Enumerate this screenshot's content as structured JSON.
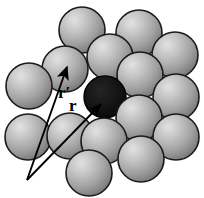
{
  "figure": {
    "background_color": "#ffffff",
    "width": 204,
    "height": 198,
    "sphere_radius": 23,
    "colors": {
      "sphere_fill_light": "#d8d8d8",
      "sphere_fill_mid": "#9a9a9a",
      "sphere_fill_dark": "#6e6e6e",
      "sphere_outline": "#1a1a1a",
      "dark_sphere_fill": "#141414",
      "dark_sphere_outline": "#000000",
      "vector_color": "#000000"
    },
    "spheres": [
      {
        "name": "sphere-top-center",
        "cx": 82,
        "cy": 30,
        "r": 23,
        "shade": "light"
      },
      {
        "name": "sphere-top-right",
        "cx": 139,
        "cy": 33,
        "r": 23,
        "shade": "light"
      },
      {
        "name": "sphere-right-upper",
        "cx": 175,
        "cy": 55,
        "r": 23,
        "shade": "light"
      },
      {
        "name": "sphere-upper-left",
        "cx": 65,
        "cy": 69,
        "r": 23,
        "shade": "light"
      },
      {
        "name": "sphere-left-upper",
        "cx": 29,
        "cy": 86,
        "r": 23,
        "shade": "light"
      },
      {
        "name": "sphere-mid-upper-center",
        "cx": 110,
        "cy": 57,
        "r": 23,
        "shade": "light"
      },
      {
        "name": "sphere-mid-right",
        "cx": 140,
        "cy": 75,
        "r": 23,
        "shade": "light"
      },
      {
        "name": "sphere-right-middle",
        "cx": 176,
        "cy": 97,
        "r": 23,
        "shade": "light"
      },
      {
        "name": "sphere-center-dark",
        "cx": 105,
        "cy": 97,
        "r": 21,
        "shade": "dark"
      },
      {
        "name": "sphere-mid-lower-right",
        "cx": 139,
        "cy": 118,
        "r": 23,
        "shade": "light"
      },
      {
        "name": "sphere-right-lower",
        "cx": 176,
        "cy": 137,
        "r": 23,
        "shade": "light"
      },
      {
        "name": "sphere-left-lower",
        "cx": 28,
        "cy": 137,
        "r": 23,
        "shade": "light"
      },
      {
        "name": "sphere-lower-center-left",
        "cx": 70,
        "cy": 136,
        "r": 23,
        "shade": "light"
      },
      {
        "name": "sphere-lower-center",
        "cx": 104,
        "cy": 141,
        "r": 23,
        "shade": "light"
      },
      {
        "name": "sphere-bottom-center",
        "cx": 89,
        "cy": 173,
        "r": 23,
        "shade": "light"
      },
      {
        "name": "sphere-bottom-right",
        "cx": 141,
        "cy": 159,
        "r": 23,
        "shade": "light"
      }
    ],
    "vectors": [
      {
        "name": "vector-r-prime",
        "label": "r′",
        "origin_x": 27,
        "origin_y": 180,
        "tip_x": 67,
        "tip_y": 67,
        "head_width": 11,
        "head_length": 17
      },
      {
        "name": "vector-r",
        "label": "r",
        "origin_x": 27,
        "origin_y": 180,
        "tip_x": 101,
        "tip_y": 104,
        "head_width": 9,
        "head_length": 15
      }
    ],
    "labels": {
      "r_prime": "r′",
      "r": "r"
    }
  }
}
